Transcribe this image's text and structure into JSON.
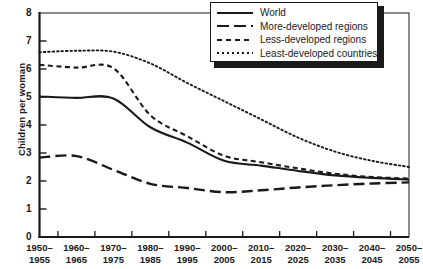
{
  "chart_data": {
    "type": "line",
    "title": "",
    "xlabel": "",
    "ylabel": "Children per woman",
    "ylim": [
      0,
      8
    ],
    "yticks": [
      0,
      1,
      2,
      3,
      4,
      5,
      6,
      7,
      8
    ],
    "grid": false,
    "legend_position": "top-right",
    "categories": [
      "1950–\n1955",
      "1960–\n1965",
      "1970–\n1975",
      "1980–\n1985",
      "1990–\n1995",
      "2000–\n2005",
      "2010–\n2015",
      "2020–\n2025",
      "2030–\n2035",
      "2040–\n2045",
      "2050–\n2055"
    ],
    "series": [
      {
        "name": "World",
        "style": "solid",
        "values": [
          5.02,
          4.97,
          4.95,
          3.92,
          3.37,
          2.72,
          2.55,
          2.36,
          2.2,
          2.11,
          2.05
        ]
      },
      {
        "name": "More-developed regions",
        "style": "long-dash",
        "values": [
          2.84,
          2.89,
          2.4,
          1.9,
          1.75,
          1.6,
          1.67,
          1.77,
          1.85,
          1.91,
          1.95
        ]
      },
      {
        "name": "Less-developed regions",
        "style": "short-dash",
        "values": [
          6.15,
          6.05,
          6.03,
          4.35,
          3.6,
          2.9,
          2.67,
          2.45,
          2.26,
          2.14,
          2.09
        ]
      },
      {
        "name": "Least-developed countries",
        "style": "dotted",
        "values": [
          6.6,
          6.65,
          6.62,
          6.2,
          5.5,
          4.85,
          4.2,
          3.55,
          3.05,
          2.72,
          2.5
        ]
      }
    ]
  },
  "axis": {
    "y_ticks": [
      "0",
      "1",
      "2",
      "3",
      "4",
      "5",
      "6",
      "7",
      "8"
    ],
    "y_title": "Children per woman",
    "x_ticks": [
      {
        "top": "1950–",
        "bottom": "1955"
      },
      {
        "top": "1960–",
        "bottom": "1965"
      },
      {
        "top": "1970–",
        "bottom": "1975"
      },
      {
        "top": "1980–",
        "bottom": "1985"
      },
      {
        "top": "1990–",
        "bottom": "1995"
      },
      {
        "top": "2000–",
        "bottom": "2005"
      },
      {
        "top": "2010–",
        "bottom": "2015"
      },
      {
        "top": "2020–",
        "bottom": "2025"
      },
      {
        "top": "2030–",
        "bottom": "2035"
      },
      {
        "top": "2040–",
        "bottom": "2045"
      },
      {
        "top": "2050–",
        "bottom": "2055"
      }
    ]
  },
  "legend": {
    "items": [
      {
        "label": "World",
        "style": "solid"
      },
      {
        "label": "More-developed regions",
        "style": "long-dash"
      },
      {
        "label": "Less-developed regions",
        "style": "short-dash"
      },
      {
        "label": "Least-developed countries",
        "style": "dotted"
      }
    ]
  },
  "colors": {
    "ink": "#1a1a1a",
    "background": "#ffffff"
  }
}
